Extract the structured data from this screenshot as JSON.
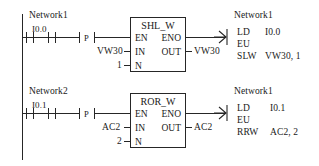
{
  "diagram": {
    "line_color": "#262626",
    "background": "#ffffff"
  },
  "rungs": [
    {
      "network_label": "Network1",
      "contacts": [
        {
          "name": "contact-1",
          "address": "I0.0"
        },
        {
          "name": "contact-2",
          "address": ""
        }
      ],
      "transition": {
        "label": "P",
        "name": "positive-transition-contact"
      },
      "block": {
        "title": "SHL_W",
        "pins": {
          "en": "EN",
          "eno": "ENO",
          "in": "IN",
          "out": "OUT",
          "n": "N"
        },
        "in_value": "VW30",
        "n_value": "1",
        "out_value": "VW30"
      },
      "il": {
        "network_label": "Network1",
        "lines": [
          {
            "op": "LD",
            "operand": "I0.0"
          },
          {
            "op": "EU",
            "operand": ""
          },
          {
            "op": "SLW",
            "operand": "VW30, 1"
          }
        ]
      }
    },
    {
      "network_label": "Network2",
      "contacts": [
        {
          "name": "contact-1",
          "address": "I0.1"
        },
        {
          "name": "contact-2",
          "address": ""
        }
      ],
      "transition": {
        "label": "P",
        "name": "positive-transition-contact"
      },
      "block": {
        "title": "ROR_W",
        "pins": {
          "en": "EN",
          "eno": "ENO",
          "in": "IN",
          "out": "OUT",
          "n": "N"
        },
        "in_value": "AC2",
        "n_value": "2",
        "out_value": "AC2"
      },
      "il": {
        "network_label": "Network1",
        "lines": [
          {
            "op": "LD",
            "operand": "I0.1"
          },
          {
            "op": "EU",
            "operand": ""
          },
          {
            "op": "RRW",
            "operand": "AC2, 2"
          }
        ]
      }
    }
  ]
}
